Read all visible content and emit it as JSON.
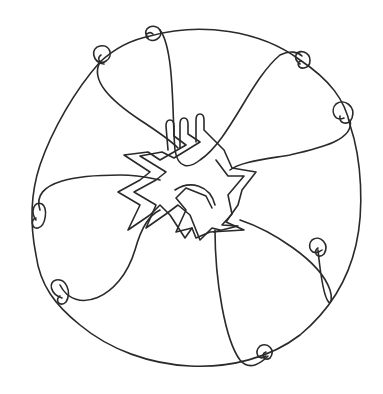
{
  "artwork": {
    "description": "Continuous-line drawing: an irregular circle ringed with eight small curls, six looping petal lines meeting at a cluster of overlapping zig-zag figures in the centre",
    "stroke_color": "#2a2a2a",
    "background_color": "#ffffff",
    "curl_count": 8,
    "petal_count": 6,
    "center_figure_count": 3
  }
}
